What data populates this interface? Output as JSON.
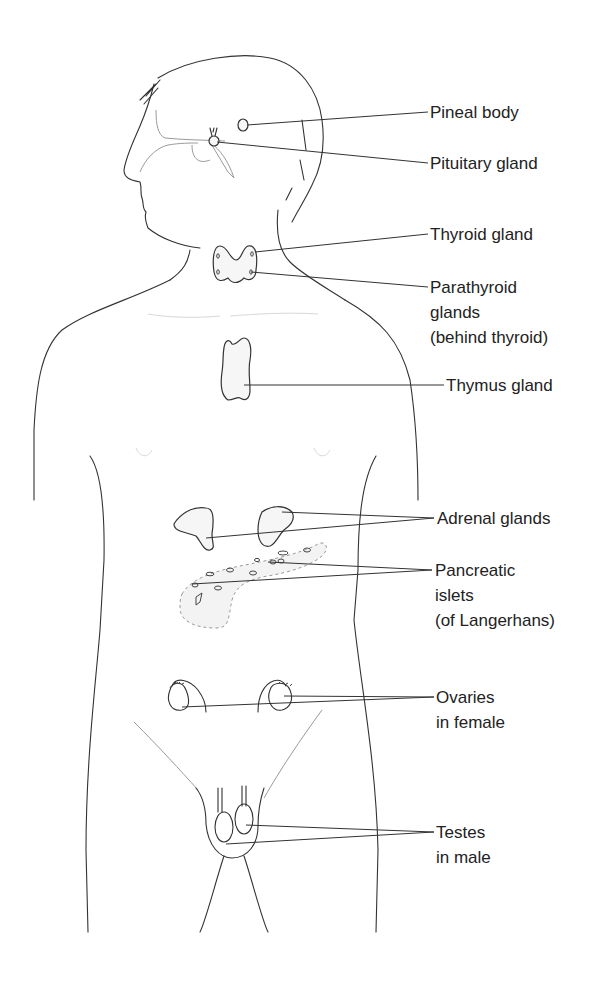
{
  "diagram": {
    "labels": [
      {
        "id": "pineal",
        "lines": [
          "Pineal body"
        ]
      },
      {
        "id": "pituitary",
        "lines": [
          "Pituitary gland"
        ]
      },
      {
        "id": "thyroid",
        "lines": [
          "Thyroid gland"
        ]
      },
      {
        "id": "parathyroid",
        "lines": [
          "Parathyroid",
          "glands",
          "(behind thyroid)"
        ]
      },
      {
        "id": "thymus",
        "lines": [
          "Thymus gland"
        ]
      },
      {
        "id": "adrenal",
        "lines": [
          "Adrenal glands"
        ]
      },
      {
        "id": "pancreatic",
        "lines": [
          "Pancreatic",
          "islets",
          "(of Langerhans)"
        ]
      },
      {
        "id": "ovaries",
        "lines": [
          "Ovaries",
          "in female"
        ]
      },
      {
        "id": "testes",
        "lines": [
          "Testes",
          "in male"
        ]
      }
    ]
  }
}
